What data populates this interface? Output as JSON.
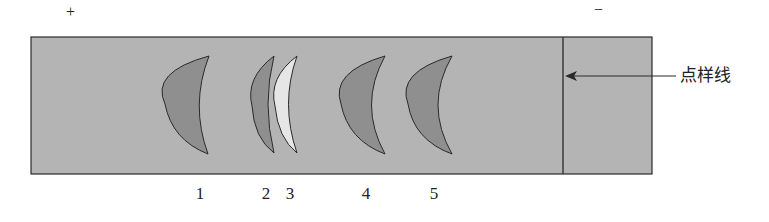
{
  "diagram": {
    "type": "electrophoresis-strip",
    "electrodes": {
      "positive": "+",
      "negative": "−"
    },
    "sample_line_label": "点样线",
    "bands": [
      {
        "id": 1,
        "label": "1",
        "style": "filled"
      },
      {
        "id": 2,
        "label": "2",
        "style": "filled"
      },
      {
        "id": 3,
        "label": "3",
        "style": "hollow"
      },
      {
        "id": 4,
        "label": "4",
        "style": "filled"
      },
      {
        "id": 5,
        "label": "5",
        "style": "filled"
      }
    ],
    "colors": {
      "strip": "#b4b4b4",
      "band": "#8f8f8f",
      "outline": "#2a2a2a",
      "hollow_band": "#e6e6e6"
    }
  }
}
